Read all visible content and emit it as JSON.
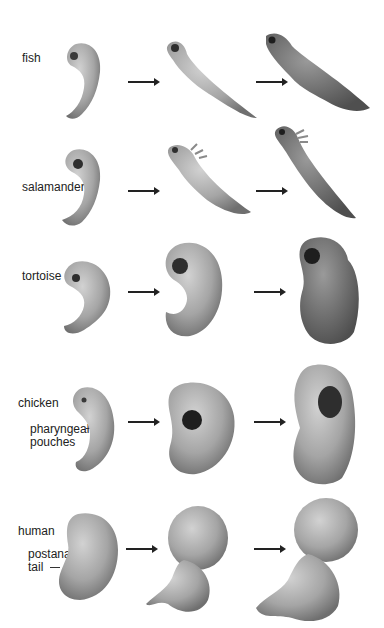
{
  "figure": {
    "rows": [
      {
        "species": "fish",
        "stages": [
          "early embryo",
          "mid embryo",
          "late embryo"
        ]
      },
      {
        "species": "salamander",
        "stages": [
          "early embryo",
          "mid embryo",
          "late embryo"
        ]
      },
      {
        "species": "tortoise",
        "stages": [
          "early embryo",
          "mid embryo",
          "late embryo"
        ]
      },
      {
        "species": "chicken",
        "stages": [
          "early embryo",
          "mid embryo",
          "late embryo"
        ],
        "annotation": "pharyngeal\npouches"
      },
      {
        "species": "human",
        "stages": [
          "early embryo",
          "mid embryo",
          "late embryo"
        ],
        "annotation": "postanal\ntail"
      }
    ],
    "annotations": {
      "pharyngeal_line1": "pharyngeal",
      "pharyngeal_line2": "pouches",
      "postanal_line1": "postanal",
      "postanal_line2": "tail"
    },
    "colors": {
      "embryo_fill": "#a9a9a9",
      "embryo_shade": "#7a7a7a",
      "text": "#222222",
      "arrow": "#222222"
    }
  }
}
